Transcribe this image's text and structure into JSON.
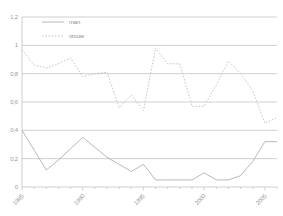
{
  "chart_data": {
    "type": "line",
    "title": "",
    "xlabel": "",
    "ylabel": "",
    "grid": true,
    "legend_position": "top-left-inside",
    "xlim": [
      1985,
      2006
    ],
    "ylim": [
      0,
      1.2
    ],
    "ytick_labels": [
      "1,2",
      "1",
      "0,8",
      "0,6",
      "0,4",
      "0,2",
      "0"
    ],
    "ytick_values": [
      1.2,
      1,
      0.8,
      0.6,
      0.4,
      0.2,
      0
    ],
    "xtick_labels": [
      "1985",
      "1990",
      "1995",
      "2000",
      "2005"
    ],
    "xtick_values": [
      1985,
      1990,
      1995,
      2000,
      2005
    ],
    "x": [
      1985,
      1986,
      1987,
      1988,
      1989,
      1990,
      1991,
      1992,
      1993,
      1994,
      1995,
      1996,
      1997,
      1998,
      1999,
      2000,
      2001,
      2002,
      2003,
      2004,
      2005,
      2006
    ],
    "series": [
      {
        "name": "man",
        "style": "solid",
        "color": "#b0b0b0",
        "values": [
          0.4,
          0.26,
          0.12,
          0.19,
          0.27,
          0.35,
          0.28,
          0.21,
          0.16,
          0.11,
          0.16,
          0.05,
          0.05,
          0.05,
          0.05,
          0.1,
          0.05,
          0.05,
          0.08,
          0.18,
          0.32,
          0.32
        ]
      },
      {
        "name": "vrouw",
        "style": "dotted",
        "color": "#c0c0c0",
        "values": [
          0.97,
          0.86,
          0.84,
          0.87,
          0.91,
          0.78,
          0.8,
          0.81,
          0.56,
          0.65,
          0.54,
          0.98,
          0.87,
          0.87,
          0.57,
          0.57,
          0.72,
          0.89,
          0.8,
          0.68,
          0.45,
          0.49
        ]
      }
    ]
  },
  "legend": {
    "items": [
      {
        "label": "man"
      },
      {
        "label": "vrouw"
      }
    ]
  }
}
